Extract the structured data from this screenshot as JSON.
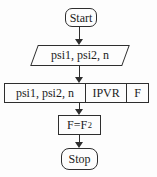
{
  "flowchart": {
    "nodes": {
      "start": {
        "label": "Start"
      },
      "input": {
        "label": "psi1, psi2, n"
      },
      "process": {
        "cells": [
          "psi1, psi2, n",
          "IPVR",
          "F"
        ]
      },
      "assign": {
        "base": "F=F",
        "exponent": "2"
      },
      "stop": {
        "label": "Stop"
      }
    },
    "colors": {
      "stroke": "#2e2e2e",
      "text": "#1c1c1c",
      "background": "#fdfdfd"
    }
  }
}
